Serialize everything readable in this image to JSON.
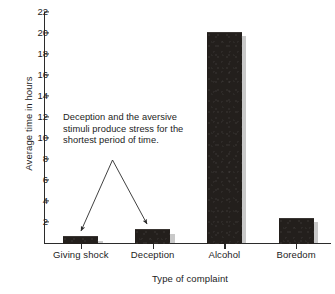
{
  "chart_data": {
    "type": "bar",
    "title": "",
    "categories": [
      "Giving shock",
      "Deception",
      "Alcohol",
      "Boredom"
    ],
    "values": [
      0.65,
      1.3,
      20.1,
      2.4
    ],
    "series": [
      {
        "name": "Average time in hours",
        "values": [
          0.65,
          1.3,
          20.1,
          2.4
        ]
      }
    ],
    "xlabel": "Type of complaint",
    "ylabel": "Average time in hours",
    "ylim": [
      0,
      22
    ],
    "ytick_values": [
      2,
      4,
      6,
      8,
      10,
      12,
      14,
      16,
      18,
      20,
      22
    ],
    "ytick_labels": [
      "2",
      "4",
      "6",
      "8",
      "10",
      "12",
      "14",
      "16",
      "18",
      "20",
      "22"
    ],
    "grid": false,
    "legend": false,
    "bar_color": "#231f1c",
    "shadow_color": "#c9c9c9",
    "axis_color": "#2b2b2b",
    "background_color": "#ffffff",
    "annotations": [
      {
        "text": "Deception and the aversive stimuli produce stress for the shortest period of time.",
        "lines": [
          "Deception and the aversive",
          "stimuli produce stress for the",
          "shortest period of time."
        ],
        "points_to": [
          "Giving shock",
          "Deception"
        ],
        "arrow_count": 2
      }
    ]
  }
}
